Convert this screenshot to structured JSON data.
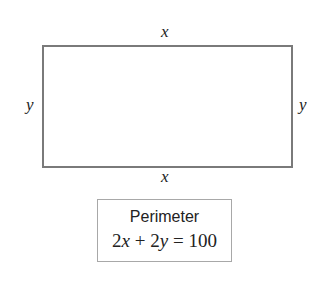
{
  "diagram": {
    "rectangle": {
      "top_label": "x",
      "bottom_label": "x",
      "left_label": "y",
      "right_label": "y"
    },
    "perimeter_box": {
      "title": "Perimeter",
      "equation": {
        "coef1": "2",
        "var1": "x",
        "plus": " + ",
        "coef2": "2",
        "var2": "y",
        "rhs": " = 100"
      }
    },
    "colors": {
      "rectangle_border": "#7a7a7a",
      "box_border": "#a8a8a8",
      "text": "#222222"
    }
  }
}
